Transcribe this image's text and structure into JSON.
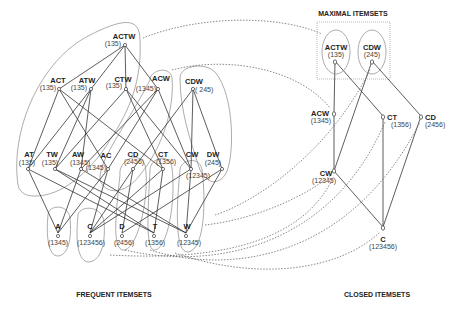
{
  "titles": {
    "frequent": "FREQUENT ITEMSETS",
    "maximal": "MAXIMAL ITEMSETS",
    "closed": "CLOSED ITEMSETS"
  },
  "frequent": {
    "level4": [
      {
        "id": "ACTW",
        "label": "ACTW",
        "support": "(135)",
        "x": 125,
        "y": 45
      }
    ],
    "level3": [
      {
        "id": "ACT",
        "label": "ACT",
        "support": "(135)",
        "x": 59,
        "y": 89
      },
      {
        "id": "ATW",
        "label": "ATW",
        "support": "(135)",
        "x": 91,
        "y": 89
      },
      {
        "id": "CTW",
        "label": "CTW",
        "support": "(135)",
        "x": 126,
        "y": 89
      },
      {
        "id": "ACW",
        "label": "ACW",
        "support": "(1345)",
        "x": 158,
        "y": 89
      },
      {
        "id": "CDW",
        "label": "CDW",
        "support": "( 245)",
        "x": 193,
        "y": 89
      }
    ],
    "level2": [
      {
        "id": "AT",
        "label": "AT",
        "support": "(135)",
        "x": 28,
        "y": 169
      },
      {
        "id": "TW",
        "label": "TW",
        "support": "(135)",
        "x": 55,
        "y": 169
      },
      {
        "id": "AW",
        "label": "AW",
        "support": "(1345)",
        "x": 81,
        "y": 169
      },
      {
        "id": "AC",
        "label": "AC",
        "support": "(1345)",
        "x": 108,
        "y": 169
      },
      {
        "id": "CD",
        "label": "CD",
        "support": "(2456)",
        "x": 133,
        "y": 169
      },
      {
        "id": "CT",
        "label": "CT",
        "support": "(1356)",
        "x": 163,
        "y": 169
      },
      {
        "id": "CW",
        "label": "CW",
        "support": "(12345)",
        "x": 191,
        "y": 169
      },
      {
        "id": "DW",
        "label": "DW",
        "support": "(245)",
        "x": 222,
        "y": 169
      }
    ],
    "level1": [
      {
        "id": "A",
        "label": "A",
        "support": "(1345)",
        "x": 58,
        "y": 233
      },
      {
        "id": "C",
        "label": "C",
        "support": "(123456)",
        "x": 90,
        "y": 233
      },
      {
        "id": "D",
        "label": "D",
        "support": "(2456)",
        "x": 122,
        "y": 233
      },
      {
        "id": "T",
        "label": "T",
        "support": "(1356)",
        "x": 154,
        "y": 233
      },
      {
        "id": "W",
        "label": "W",
        "support": "(12345)",
        "x": 186,
        "y": 233
      }
    ]
  },
  "maximal": [
    {
      "id": "ACTW",
      "label": "ACTW",
      "support": "(135)",
      "x": 335,
      "y": 61
    },
    {
      "id": "CDW",
      "label": "CDW",
      "support": "(245)",
      "x": 372,
      "y": 61
    }
  ],
  "closed": [
    {
      "id": "ACW",
      "label": "ACW",
      "support": "(1345)",
      "x": 334,
      "y": 113
    },
    {
      "id": "CT",
      "label": "CT",
      "support": "(1356)",
      "x": 383,
      "y": 116
    },
    {
      "id": "CD",
      "label": "CD",
      "support": "(2456)",
      "x": 421,
      "y": 116
    },
    {
      "id": "CW",
      "label": "CW",
      "support": "(12345)",
      "x": 334,
      "y": 171
    },
    {
      "id": "C",
      "label": "C",
      "support": "(123456)",
      "x": 383,
      "y": 227
    }
  ]
}
